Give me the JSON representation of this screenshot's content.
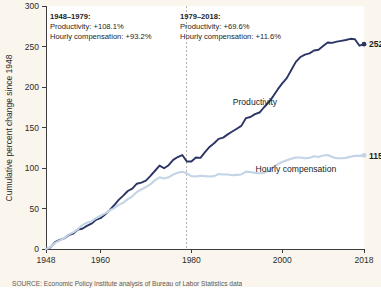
{
  "figure": {
    "background_color": "#faf6ee",
    "plot_background_color": "#ffffff"
  },
  "annotations": {
    "left": {
      "period": "1948–1979:",
      "productivity": "Productivity: +108.1%",
      "compensation": "Hourly compensation: +93.2%"
    },
    "right": {
      "period": "1979–2018:",
      "productivity": "Productivity: +69.6%",
      "compensation": "Hourly compensation: +11.6%"
    }
  },
  "source": {
    "text": "SOURCE: Economic Policy Institute analysis of Bureau of Labor Statistics data"
  },
  "chart_data": {
    "type": "line",
    "title": "",
    "xlabel": "",
    "ylabel": "Cumulative percent change since 1948",
    "xlim": [
      1948,
      2018
    ],
    "ylim": [
      0,
      300
    ],
    "xticks": [
      1948,
      1960,
      1980,
      2000,
      2018
    ],
    "xtick_labels": [
      "1948",
      "1960",
      "1980",
      "2000",
      "2018"
    ],
    "yticks": [
      0,
      50,
      100,
      150,
      200,
      250,
      300
    ],
    "ytick_labels": [
      "0",
      "50",
      "100",
      "150",
      "200",
      "250",
      "300"
    ],
    "grid": false,
    "legend_position": "inline-labels",
    "divider_year": 1979,
    "colors": {
      "productivity": "#2c3566",
      "compensation": "#c3d4e6"
    },
    "series": [
      {
        "name": "Productivity",
        "color": "#2c3566",
        "label_position": {
          "x": 1994,
          "y": 178
        },
        "endpoint_label": "252.9%",
        "endpoint_value": 252.9,
        "x": [
          1948,
          1949,
          1950,
          1951,
          1952,
          1953,
          1954,
          1955,
          1956,
          1957,
          1958,
          1959,
          1960,
          1961,
          1962,
          1963,
          1964,
          1965,
          1966,
          1967,
          1968,
          1969,
          1970,
          1971,
          1972,
          1973,
          1974,
          1975,
          1976,
          1977,
          1978,
          1979,
          1980,
          1981,
          1982,
          1983,
          1984,
          1985,
          1986,
          1987,
          1988,
          1989,
          1990,
          1991,
          1992,
          1993,
          1994,
          1995,
          1996,
          1997,
          1998,
          1999,
          2000,
          2001,
          2002,
          2003,
          2004,
          2005,
          2006,
          2007,
          2008,
          2009,
          2010,
          2011,
          2012,
          2013,
          2014,
          2015,
          2016,
          2017,
          2018
        ],
        "y": [
          0,
          1.9,
          8.6,
          11.2,
          13.1,
          17.0,
          19.1,
          24.0,
          25.0,
          28.5,
          31.3,
          36.0,
          38.0,
          42.5,
          48.0,
          54.0,
          60.6,
          65.9,
          71.6,
          74.6,
          80.6,
          82.0,
          84.5,
          90.4,
          96.6,
          103.0,
          99.7,
          103.5,
          110.0,
          113.5,
          116.0,
          108.1,
          108.0,
          113.0,
          112.5,
          119.5,
          126.0,
          130.5,
          136.0,
          137.5,
          141.5,
          145.0,
          148.5,
          152.0,
          161.5,
          163.0,
          166.5,
          168.5,
          175.0,
          181.0,
          188.5,
          197.0,
          204.5,
          211.0,
          221.0,
          231.0,
          237.0,
          240.0,
          241.5,
          245.0,
          246.0,
          250.5,
          255.0,
          254.5,
          256.0,
          257.0,
          258.0,
          259.5,
          259.0,
          251.0,
          252.9
        ]
      },
      {
        "name": "Hourly compensation",
        "color": "#c3d4e6",
        "label_position": {
          "x": 2003,
          "y": 95
        },
        "endpoint_label": "115.6%",
        "endpoint_value": 115.6,
        "x": [
          1948,
          1949,
          1950,
          1951,
          1952,
          1953,
          1954,
          1955,
          1956,
          1957,
          1958,
          1959,
          1960,
          1961,
          1962,
          1963,
          1964,
          1965,
          1966,
          1967,
          1968,
          1969,
          1970,
          1971,
          1972,
          1973,
          1974,
          1975,
          1976,
          1977,
          1978,
          1979,
          1980,
          1981,
          1982,
          1983,
          1984,
          1985,
          1986,
          1987,
          1988,
          1989,
          1990,
          1991,
          1992,
          1993,
          1994,
          1995,
          1996,
          1997,
          1998,
          1999,
          2000,
          2001,
          2002,
          2003,
          2004,
          2005,
          2006,
          2007,
          2008,
          2009,
          2010,
          2011,
          2012,
          2013,
          2014,
          2015,
          2016,
          2017,
          2018
        ],
        "y": [
          0,
          2.5,
          7.5,
          10.5,
          13.5,
          18.0,
          20.5,
          24.5,
          29.5,
          32.5,
          34.0,
          38.0,
          41.0,
          44.0,
          47.5,
          50.5,
          54.5,
          57.0,
          61.5,
          65.0,
          70.5,
          73.5,
          76.5,
          80.0,
          85.0,
          88.5,
          87.0,
          88.5,
          92.0,
          94.0,
          95.5,
          93.2,
          90.0,
          89.5,
          90.5,
          90.0,
          89.5,
          90.0,
          92.5,
          92.0,
          92.0,
          91.0,
          91.5,
          92.0,
          95.5,
          95.0,
          94.0,
          93.5,
          94.0,
          96.5,
          101.0,
          104.5,
          107.5,
          109.5,
          111.5,
          113.0,
          113.0,
          112.0,
          112.5,
          114.5,
          113.5,
          115.5,
          116.0,
          113.5,
          112.0,
          112.0,
          112.5,
          114.0,
          115.0,
          115.0,
          115.6
        ]
      }
    ]
  }
}
